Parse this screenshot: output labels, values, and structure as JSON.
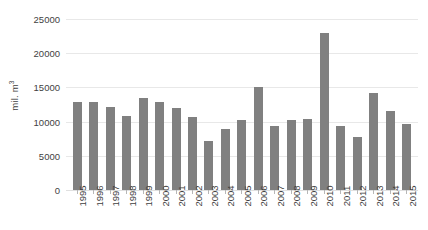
{
  "chart_data": {
    "type": "bar",
    "title": "",
    "xlabel": "",
    "ylabel": "mil. m³",
    "ylabel_base": "mil. m",
    "ylabel_superscript": "3",
    "ylim": [
      0,
      25000
    ],
    "yticks": [
      0,
      5000,
      10000,
      15000,
      20000,
      25000
    ],
    "ytick_labels": [
      "0",
      "5000",
      "10000",
      "15000",
      "20000",
      "25000"
    ],
    "grid": true,
    "legend": "none",
    "bar_color": "#808080",
    "gridline_color": "#e8e8e8",
    "text_color": "#3f3f3f",
    "categories": [
      "1995",
      "1996",
      "1997",
      "1998",
      "1999",
      "2000",
      "2001",
      "2002",
      "2003",
      "2004",
      "2005",
      "2006",
      "2007",
      "2008",
      "2009",
      "2010",
      "2011",
      "2012",
      "2013",
      "2014",
      "2015"
    ],
    "values": [
      12800,
      12900,
      12100,
      10800,
      13400,
      12800,
      12000,
      10700,
      7200,
      8900,
      10200,
      15000,
      9400,
      10300,
      10400,
      22900,
      9400,
      7800,
      14200,
      11500,
      9700
    ]
  }
}
